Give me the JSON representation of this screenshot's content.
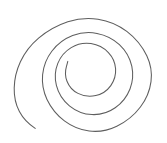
{
  "canvas": {
    "width": 167,
    "height": 143,
    "background_color": "#ffffff",
    "title": "Spiral Drawing"
  },
  "drawing": {
    "name": "hand-drawn-spiral",
    "type": "freehand-stroke",
    "stroke_color": "#5e5e5e",
    "stroke_width": 1.05,
    "fill": "none",
    "turns": 2.5,
    "direction": "inward-clockwise",
    "outer_tail_end": [
      35,
      128
    ],
    "inner_terminus": [
      68,
      62
    ],
    "bounds": {
      "left": 14,
      "top": 18,
      "right": 152,
      "bottom": 131
    },
    "path": "M35.2,128.4 C28.6,124.2 23.0,118.4 19.4,111.6 C15.6,104.4 14.0,96.4 14.2,88.0 C14.4,79.0 16.6,70.0 20.4,61.8 C24.6,52.8 30.8,44.8 38.6,38.2 C47.0,31.0 57.0,25.4 67.8,21.8 C77.6,18.6 88.0,17.6 98.0,19.2 C108.4,20.8 118.4,25.0 126.8,31.4 C135.2,37.8 142.2,46.2 146.8,55.8 C150.6,63.8 152.2,72.8 151.0,81.6 C149.8,90.8 146.0,99.6 140.4,107.0 C134.2,115.2 126.0,121.8 116.8,126.2 C108.2,130.4 98.6,132.2 89.2,131.0 C80.2,129.8 71.6,126.2 64.4,120.8 C57.0,115.2 51.0,107.8 47.0,99.4 C43.4,91.8 41.8,83.2 42.6,74.8 C43.4,66.2 46.6,58.0 51.8,51.2 C57.2,44.2 64.4,38.8 72.6,35.6 C80.4,32.6 88.8,31.8 97.0,33.4 C105.4,35.0 113.2,38.8 119.4,44.6 C125.6,50.4 130.0,58.0 131.8,66.2 C133.4,73.8 132.8,81.8 130.0,89.0 C127.0,96.6 121.8,103.2 115.2,107.8 C108.4,112.6 100.2,115.0 92.0,114.6 C83.8,114.2 75.8,111.0 69.4,105.8 C63.0,100.6 58.4,93.4 56.4,85.4 C54.6,78.2 55.0,70.4 57.8,63.4 C60.4,56.8 65.2,51.2 71.2,47.6 C77.2,44.0 84.2,42.6 91.0,43.6 C97.6,44.6 103.8,47.8 108.4,52.6 C112.6,57.0 115.2,62.8 115.6,68.8 C116.0,74.8 114.2,80.8 110.8,85.6 C107.2,90.6 101.8,94.2 95.8,95.6 C89.8,97.0 83.4,96.2 78.0,93.4 C73.0,90.8 69.0,86.4 67.0,81.2 C65.2,76.6 65.0,71.4 66.4,66.6 C67.2,63.8 67.6,62.0 67.8,61.4"
  }
}
